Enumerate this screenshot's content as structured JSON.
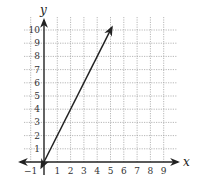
{
  "chart_data": {
    "type": "line",
    "title": "",
    "xlabel": "x",
    "ylabel": "y",
    "xlim": [
      -1,
      9.5
    ],
    "ylim": [
      -0.5,
      10.5
    ],
    "grid": true,
    "x_ticks": [
      "-1",
      "1",
      "2",
      "3",
      "4",
      "5",
      "6",
      "7",
      "8",
      "9"
    ],
    "y_ticks": [
      "1",
      "2",
      "3",
      "4",
      "5",
      "6",
      "7",
      "8",
      "9",
      "10"
    ],
    "series": [
      {
        "name": "line",
        "equation": "y = 2x",
        "x": [
          -0.2,
          0,
          1,
          2,
          3,
          4,
          5.1
        ],
        "y": [
          -0.4,
          0,
          2,
          4,
          6,
          8,
          10.2
        ],
        "arrows_both_ends": true
      }
    ],
    "colors": {
      "line": "#222222",
      "axis": "#222222",
      "grid": "#999999"
    }
  },
  "labels": {
    "x_axis": "x",
    "y_axis": "y"
  }
}
